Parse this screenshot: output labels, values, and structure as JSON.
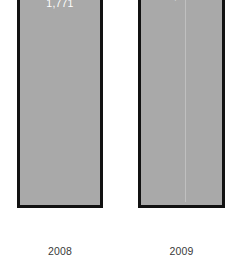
{
  "chart_data": {
    "type": "bar",
    "title": "",
    "subtitle": "",
    "xlabel": "",
    "ylabel": "",
    "categories": [
      "2008",
      "2009"
    ],
    "values": [
      1771,
      1829
    ],
    "value_labels": [
      "1,771",
      "1,829"
    ],
    "series": [
      {
        "name": "",
        "values": [
          1771,
          1829
        ]
      }
    ],
    "ylim": [
      0,
      1900
    ],
    "grid": false,
    "legend": false,
    "legend_position": "none",
    "axes_visible": false,
    "value_label_position": "inside-top",
    "orientation": "vertical"
  },
  "style": {
    "background": "#ffffff",
    "bar_fill": "#a9a9a9",
    "bar_border": "#111111",
    "value_label_color": "#ffffff",
    "category_label_color": "#3a3a3a",
    "seam_color": "#c4c4c4"
  },
  "bars": [
    {
      "category": "2008",
      "value": 1771,
      "value_label": "1,771"
    },
    {
      "category": "2009",
      "value": 1829,
      "value_label": "1,829"
    }
  ]
}
